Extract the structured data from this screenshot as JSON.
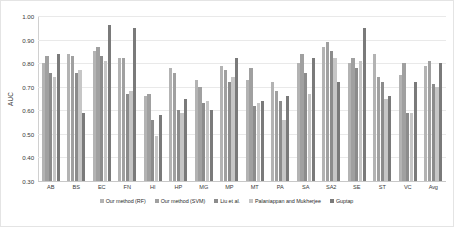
{
  "chart_data": {
    "type": "bar",
    "title": "",
    "xlabel": "",
    "ylabel": "AUC",
    "ylim": [
      0.3,
      1.0
    ],
    "ytick_step": 0.1,
    "yticks": [
      "1.00",
      "0.90",
      "0.80",
      "0.70",
      "0.60",
      "0.50",
      "0.40",
      "0.30"
    ],
    "grid": true,
    "legend_position": "bottom",
    "categories": [
      "AB",
      "BS",
      "EC",
      "FN",
      "HI",
      "HP",
      "MG",
      "MP",
      "MT",
      "PA",
      "SA",
      "SA2",
      "SE",
      "ST",
      "VC",
      "Avg"
    ],
    "series": [
      {
        "name": "Our method (RF)",
        "color": "#b3b3b3",
        "values": [
          0.8,
          0.84,
          0.85,
          0.82,
          0.66,
          0.78,
          0.73,
          0.79,
          0.73,
          0.72,
          0.8,
          0.87,
          0.8,
          0.84,
          0.75,
          0.79
        ]
      },
      {
        "name": "Our method (SVM)",
        "color": "#a0a0a0",
        "values": [
          0.83,
          0.83,
          0.87,
          0.82,
          0.67,
          0.76,
          0.7,
          0.77,
          0.78,
          0.68,
          0.84,
          0.89,
          0.82,
          0.74,
          0.8,
          0.81
        ]
      },
      {
        "name": "Liu et al.",
        "color": "#8c8c8c",
        "values": [
          0.76,
          0.76,
          0.83,
          0.67,
          0.56,
          0.6,
          0.63,
          0.72,
          0.62,
          0.64,
          0.76,
          0.85,
          0.78,
          0.72,
          0.59,
          0.71
        ]
      },
      {
        "name": "Palaniappan and Mukherjee",
        "color": "#c6c6c6",
        "values": [
          0.74,
          0.77,
          0.81,
          0.68,
          0.49,
          0.59,
          0.64,
          0.74,
          0.63,
          0.56,
          0.67,
          0.82,
          0.81,
          0.65,
          0.59,
          0.7
        ]
      },
      {
        "name": "Guptap",
        "color": "#7a7a7a",
        "values": [
          0.84,
          0.59,
          0.96,
          0.95,
          0.58,
          0.65,
          0.6,
          0.82,
          0.64,
          0.66,
          0.82,
          0.72,
          0.95,
          0.66,
          0.72,
          0.8
        ]
      }
    ]
  }
}
